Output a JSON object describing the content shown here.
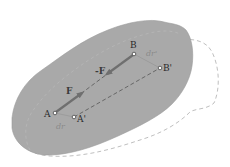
{
  "diagram": {
    "title": "",
    "colors": {
      "body_fill": "#a9a9a9",
      "body_edge": "#9a9a9a",
      "displaced_outline": "#b8b8b8",
      "force_arrow": "#6f6f6f",
      "displacement_line": "#9c9c9c",
      "dashed_segment": "#555555",
      "point_marker": "#ffffff"
    },
    "points": {
      "A": {
        "label": "A",
        "x": 55,
        "y": 113
      },
      "A_prime": {
        "label": "A'",
        "x": 74,
        "y": 117
      },
      "B": {
        "label": "B",
        "x": 134,
        "y": 54
      },
      "B_prime": {
        "label": "B'",
        "x": 160,
        "y": 68
      }
    },
    "forces": {
      "F": {
        "label": "F",
        "from": "A",
        "direction": "toward B"
      },
      "minus_F": {
        "label": "-F",
        "from": "B",
        "direction": "toward A"
      }
    },
    "displacements": {
      "dr": {
        "label": "dr",
        "from": "A",
        "to": "A'"
      },
      "dr_prime": {
        "label": "dr'",
        "from": "B",
        "to": "B'"
      }
    },
    "outlines": {
      "original_body": "solid gray shaded region",
      "displaced_body": "dashed outline"
    }
  }
}
